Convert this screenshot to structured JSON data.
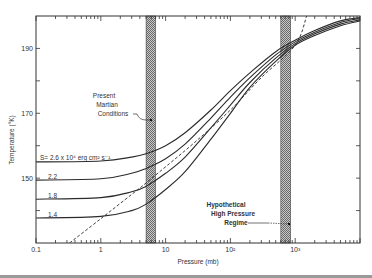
{
  "header": {
    "running_head": ""
  },
  "chart_data": {
    "type": "line",
    "title": "",
    "xlabel": "Pressure  (mb)",
    "ylabel": "Temperature (°K)",
    "xscale": "log",
    "xlim": [
      0.1,
      10000
    ],
    "ylim": [
      130,
      200
    ],
    "grid": false,
    "x_tick_labels": [
      "0.1",
      "1",
      "10",
      "10²",
      "10³"
    ],
    "x_tick_values": [
      0.1,
      1,
      10,
      100,
      1000
    ],
    "y_tick_labels": [
      "150",
      "170",
      "190"
    ],
    "y_tick_values": [
      150,
      170,
      190
    ],
    "y_minor_ticks": [
      140,
      160,
      180
    ],
    "series": [
      {
        "name": "S = 2.6 x 10^4 erg cm^2 s^-1",
        "label": "S= 2.6 x 10⁴ erg  cm² s⁻¹",
        "style": "solid",
        "x": [
          0.1,
          1,
          3,
          5,
          10,
          20,
          50,
          100,
          200,
          500,
          1000,
          2000,
          5000,
          10000
        ],
        "y": [
          155,
          155.3,
          156.5,
          157.5,
          160,
          164,
          171,
          177,
          182.5,
          189,
          192.5,
          195.5,
          198.5,
          199.5
        ]
      },
      {
        "name": "S = 2.2",
        "label": "2.2",
        "style": "solid",
        "x": [
          0.1,
          1,
          3,
          5,
          10,
          20,
          50,
          100,
          200,
          500,
          1000,
          2000,
          5000,
          10000
        ],
        "y": [
          149.4,
          149.8,
          151.5,
          153,
          156,
          160.5,
          168.5,
          175,
          181,
          188,
          192,
          195,
          198,
          199.2
        ]
      },
      {
        "name": "S = 1.8",
        "label": "1.8",
        "style": "solid",
        "x": [
          0.1,
          1,
          3,
          5,
          10,
          20,
          50,
          100,
          200,
          500,
          1000,
          2000,
          5000,
          10000
        ],
        "y": [
          143.5,
          144,
          145.8,
          147.5,
          151.5,
          156.5,
          165.5,
          172.5,
          179.5,
          187,
          191.5,
          194.5,
          197.5,
          198.8
        ]
      },
      {
        "name": "S = 1.4",
        "label": "1.4",
        "style": "solid",
        "x": [
          0.1,
          1,
          3,
          5,
          10,
          20,
          50,
          100,
          200,
          500,
          1000,
          2000,
          5000,
          10000
        ],
        "y": [
          137.7,
          138.2,
          140,
          142,
          146.5,
          152,
          162,
          170,
          178,
          186,
          191,
          194,
          197,
          198.5
        ]
      },
      {
        "name": "dashed reference",
        "label": "",
        "style": "dashed",
        "x": [
          0.33,
          1,
          3,
          5,
          10,
          30,
          100,
          300,
          1000,
          1500
        ],
        "y": [
          130,
          137.5,
          145,
          148.5,
          153.5,
          161.5,
          171,
          181,
          191,
          200
        ]
      }
    ],
    "bands": [
      {
        "name": "Present Martian Conditions",
        "x_range": [
          5,
          7
        ],
        "label_lines": [
          "Present",
          "Martian",
          "Conditions"
        ]
      },
      {
        "name": "Hypothetical High Pressure Regime",
        "x_range": [
          600,
          850
        ],
        "label_lines": [
          "Hypothetical",
          "High Pressure",
          "Regime"
        ]
      }
    ]
  },
  "colors": {
    "line": "#2a2a2a",
    "band_fill": "#9a9a9a",
    "frame": "#333333"
  }
}
